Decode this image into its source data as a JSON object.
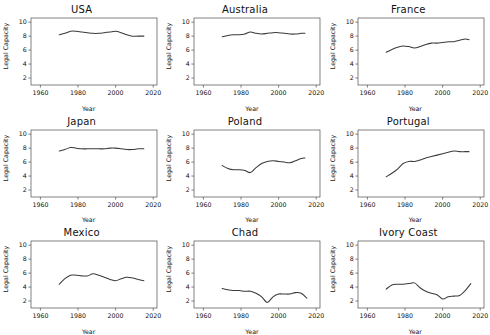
{
  "figure": {
    "layout": "3x3-small-multiples",
    "rows": 3,
    "cols": 3,
    "background": "#ffffff",
    "line_color": "#3a3a3a",
    "axis_color": "#4d4d4d"
  },
  "axes": {
    "xlabel": "Year",
    "ylabel": "Legal Capacity",
    "xticks": [
      "1960",
      "1980",
      "2000",
      "2020"
    ],
    "xtick_values": [
      1960,
      1980,
      2000,
      2020
    ],
    "yticks": [
      "2",
      "4",
      "6",
      "8",
      "10"
    ],
    "ytick_values": [
      2,
      4,
      6,
      8,
      10
    ],
    "xlim": [
      1955,
      2022
    ],
    "ylim": [
      1.0,
      10.6
    ],
    "grid": false
  },
  "chart_data": {
    "type": "line",
    "title": "",
    "xlabel": "Year",
    "ylabel": "Legal Capacity",
    "xlim": [
      1955,
      2022
    ],
    "ylim": [
      1.0,
      10.6
    ],
    "grid": false,
    "legend": "none",
    "panels": [
      {
        "title": "USA",
        "x": [
          1970,
          1973,
          1976,
          1979,
          1982,
          1985,
          1988,
          1991,
          1994,
          1997,
          2000,
          2003,
          2006,
          2009,
          2012,
          2015
        ],
        "values": [
          8.2,
          8.4,
          8.7,
          8.7,
          8.6,
          8.5,
          8.4,
          8.4,
          8.5,
          8.6,
          8.7,
          8.5,
          8.2,
          8.0,
          8.0,
          8.0
        ]
      },
      {
        "title": "Australia",
        "x": [
          1970,
          1973,
          1976,
          1979,
          1982,
          1985,
          1988,
          1991,
          1994,
          1997,
          2000,
          2003,
          2006,
          2009,
          2012,
          2014
        ],
        "values": [
          7.9,
          8.1,
          8.2,
          8.2,
          8.3,
          8.6,
          8.4,
          8.3,
          8.4,
          8.5,
          8.5,
          8.4,
          8.3,
          8.3,
          8.4,
          8.4
        ]
      },
      {
        "title": "France",
        "x": [
          1970,
          1973,
          1976,
          1979,
          1982,
          1985,
          1988,
          1991,
          1994,
          1997,
          2000,
          2003,
          2006,
          2009,
          2012,
          2014
        ],
        "values": [
          5.7,
          6.1,
          6.4,
          6.6,
          6.5,
          6.3,
          6.5,
          6.8,
          7.0,
          7.0,
          7.1,
          7.2,
          7.2,
          7.4,
          7.6,
          7.5
        ]
      },
      {
        "title": "Japan",
        "x": [
          1970,
          1973,
          1976,
          1979,
          1982,
          1985,
          1988,
          1991,
          1994,
          1997,
          2000,
          2003,
          2006,
          2009,
          2012,
          2015
        ],
        "values": [
          7.6,
          7.8,
          8.1,
          8.0,
          7.9,
          7.9,
          7.9,
          7.9,
          7.9,
          8.0,
          8.0,
          7.9,
          7.8,
          7.8,
          7.9,
          7.9
        ]
      },
      {
        "title": "Poland",
        "x": [
          1970,
          1973,
          1976,
          1979,
          1982,
          1985,
          1988,
          1991,
          1994,
          1997,
          2000,
          2003,
          2006,
          2009,
          2012,
          2014
        ],
        "values": [
          5.5,
          5.1,
          4.9,
          4.9,
          4.8,
          4.5,
          5.2,
          5.8,
          6.1,
          6.2,
          6.1,
          6.0,
          5.9,
          6.2,
          6.5,
          6.6
        ]
      },
      {
        "title": "Portugal",
        "x": [
          1970,
          1973,
          1976,
          1979,
          1982,
          1985,
          1988,
          1991,
          1994,
          1997,
          2000,
          2003,
          2006,
          2009,
          2012,
          2014
        ],
        "values": [
          3.9,
          4.4,
          5.0,
          5.8,
          6.1,
          6.1,
          6.3,
          6.6,
          6.8,
          7.0,
          7.2,
          7.4,
          7.6,
          7.5,
          7.5,
          7.5
        ]
      },
      {
        "title": "Mexico",
        "x": [
          1970,
          1973,
          1976,
          1979,
          1982,
          1985,
          1988,
          1991,
          1994,
          1997,
          2000,
          2003,
          2006,
          2009,
          2012,
          2015
        ],
        "values": [
          4.4,
          5.2,
          5.7,
          5.7,
          5.6,
          5.6,
          5.9,
          5.7,
          5.4,
          5.1,
          4.9,
          5.2,
          5.4,
          5.3,
          5.1,
          4.9
        ]
      },
      {
        "title": "Chad",
        "x": [
          1970,
          1973,
          1976,
          1979,
          1982,
          1985,
          1988,
          1991,
          1994,
          1997,
          2000,
          2003,
          2006,
          2009,
          2012,
          2015
        ],
        "values": [
          3.8,
          3.6,
          3.5,
          3.5,
          3.4,
          3.4,
          3.1,
          2.6,
          1.8,
          2.6,
          3.0,
          3.0,
          3.0,
          3.2,
          3.1,
          2.4
        ]
      },
      {
        "title": "Ivory Coast",
        "x": [
          1970,
          1973,
          1976,
          1979,
          1982,
          1985,
          1988,
          1991,
          1994,
          1997,
          2000,
          2003,
          2006,
          2009,
          2012,
          2015
        ],
        "values": [
          3.7,
          4.3,
          4.4,
          4.4,
          4.5,
          4.6,
          3.9,
          3.4,
          3.1,
          2.9,
          2.3,
          2.6,
          2.7,
          2.8,
          3.5,
          4.5
        ]
      }
    ]
  }
}
